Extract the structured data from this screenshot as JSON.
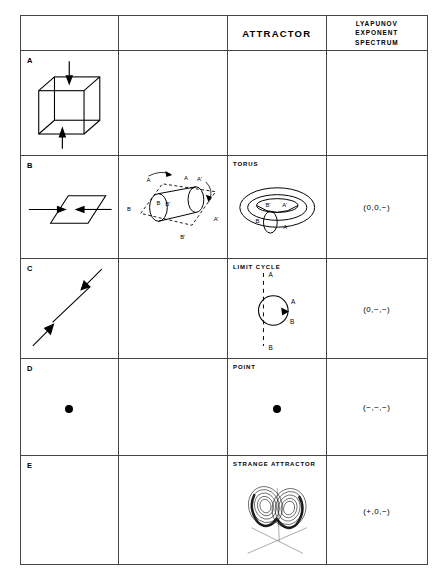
{
  "figure": {
    "type": "classification-table",
    "columns": [
      {
        "key": "phase_space",
        "header": ""
      },
      {
        "key": "evolution",
        "header": ""
      },
      {
        "key": "attractor",
        "header": "ATTRACTOR"
      },
      {
        "key": "lyapunov",
        "header_lines": [
          "LYAPUNOV",
          "EXPONENT",
          "SPECTRUM"
        ]
      }
    ],
    "rows": [
      {
        "letter": "A",
        "phase_space_icon": "cube-with-inward-arrows",
        "evolution_icon": "",
        "attractor_label": "",
        "attractor_icon": "",
        "lyapunov": ""
      },
      {
        "letter": "B",
        "phase_space_icon": "plane-with-inward-arrows",
        "evolution_icon": "cylinder-in-dashed-parallelogram",
        "evolution_labels": [
          "A",
          "A'",
          "B",
          "B'",
          "A''",
          "B''"
        ],
        "attractor_label": "TORUS",
        "attractor_icon": "torus",
        "attractor_labels": [
          "B'",
          "A'",
          "B",
          "A"
        ],
        "lyapunov": "(0,0,−)"
      },
      {
        "letter": "C",
        "phase_space_icon": "diagonal-line-with-inward-arrows",
        "evolution_icon": "",
        "attractor_label": "LIMIT CYCLE",
        "attractor_icon": "circle-with-dashed-axis",
        "attractor_labels": [
          "A",
          "A",
          "B",
          "B"
        ],
        "lyapunov": "(0,−,−)"
      },
      {
        "letter": "D",
        "phase_space_icon": "single-point",
        "evolution_icon": "",
        "attractor_label": "POINT",
        "attractor_icon": "single-point",
        "lyapunov": "(−,−,−)"
      },
      {
        "letter": "E",
        "phase_space_icon": "",
        "evolution_icon": "",
        "attractor_label": "STRANGE ATTRACTOR",
        "attractor_icon": "lorenz-butterfly-with-axes",
        "lyapunov": "(+,0,−)"
      }
    ]
  },
  "colors": {
    "ink": "#000000",
    "grid": "#444444",
    "background": "#ffffff"
  }
}
